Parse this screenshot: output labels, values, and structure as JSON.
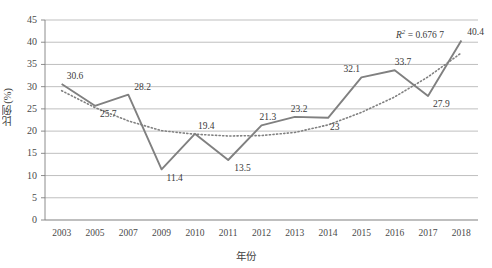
{
  "chart_data": {
    "type": "line",
    "title": "",
    "xlabel": "年份",
    "ylabel": "比例(%)",
    "ylim": [
      0,
      45
    ],
    "ytick_step": 5,
    "grid": true,
    "legend": "none",
    "categories": [
      "2003",
      "2005",
      "2007",
      "2009",
      "2010",
      "2011",
      "2012",
      "2013",
      "2014",
      "2015",
      "2016",
      "2017",
      "2018"
    ],
    "yticks": [
      "0",
      "5",
      "10",
      "15",
      "20",
      "25",
      "30",
      "35",
      "40",
      "45"
    ],
    "series": [
      {
        "name": "比例",
        "style": "solid",
        "color": "#808080",
        "values": [
          30.6,
          25.7,
          28.2,
          11.4,
          19.4,
          13.5,
          21.3,
          23.2,
          23,
          32.1,
          33.7,
          27.9,
          40.4
        ],
        "labels": [
          "30.6",
          "25.7",
          "28.2",
          "11.4",
          "19.4",
          "13.5",
          "21.3",
          "23.2",
          "23",
          "32.1",
          "33.7",
          "27.9",
          "40.4"
        ]
      },
      {
        "name": "趋势线",
        "style": "dotted",
        "color": "#808080",
        "trendline": true,
        "values": [
          29.1,
          25.3,
          22.3,
          20.1,
          19.3,
          18.9,
          19.0,
          19.7,
          21.4,
          24.2,
          27.7,
          32.2,
          37.6
        ]
      }
    ],
    "annotations": [
      {
        "name": "r-squared",
        "prefix": "R",
        "sup": "2",
        "text": " = 0.676 7",
        "value": 0.6767
      }
    ]
  },
  "colors": {
    "line": "#808080",
    "grid": "#aeaeae",
    "axis": "#808080",
    "text": "#404040"
  }
}
